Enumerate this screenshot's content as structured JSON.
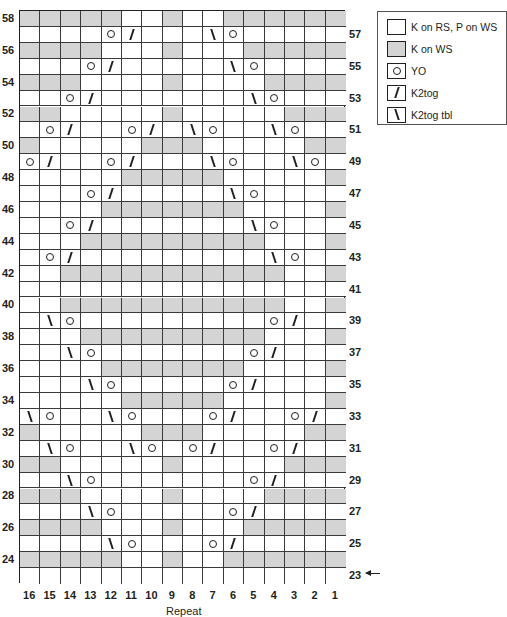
{
  "chart": {
    "columns": [
      "16",
      "15",
      "14",
      "13",
      "12",
      "11",
      "10",
      "9",
      "8",
      "7",
      "6",
      "5",
      "4",
      "3",
      "2",
      "1"
    ],
    "column_footer_label": "Repeat",
    "start_row_indicator": {
      "row": "23",
      "icon": "left-arrow-icon"
    },
    "rows": [
      {
        "num": "58",
        "side": "left",
        "cells": "ggggg..g..gggggg"
      },
      {
        "num": "57",
        "side": "right",
        "cells": "....o/...\\o....."
      },
      {
        "num": "56",
        "side": "left",
        "cells": "gggg...g...ggggg"
      },
      {
        "num": "55",
        "side": "right",
        "cells": "...o/.....\\o...."
      },
      {
        "num": "54",
        "side": "left",
        "cells": "ggg....g....gggg"
      },
      {
        "num": "53",
        "side": "right",
        "cells": "..o/.......\\o..."
      },
      {
        "num": "52",
        "side": "left",
        "cells": "gg.....g.....ggg"
      },
      {
        "num": "51",
        "side": "right",
        "cells": ".o/..o/.\\o..\\o.."
      },
      {
        "num": "50",
        "side": "left",
        "cells": "g.....ggg.....gg"
      },
      {
        "num": "49",
        "side": "right",
        "cells": "o/..o/...\\o..\\o."
      },
      {
        "num": "48",
        "side": "left",
        "cells": ".....ggggg.....g"
      },
      {
        "num": "47",
        "side": "right",
        "cells": "...o/.....\\o...."
      },
      {
        "num": "46",
        "side": "left",
        "cells": "....ggggggg....g"
      },
      {
        "num": "45",
        "side": "right",
        "cells": "..o/.......\\o..."
      },
      {
        "num": "44",
        "side": "left",
        "cells": "...ggggggggg...g"
      },
      {
        "num": "43",
        "side": "right",
        "cells": ".o/.........\\o.."
      },
      {
        "num": "42",
        "side": "left",
        "cells": "..ggggggggggg..g"
      },
      {
        "num": "41",
        "side": "right",
        "cells": "................"
      },
      {
        "num": "40",
        "side": "left",
        "cells": "..ggggggggggg..g"
      },
      {
        "num": "39",
        "side": "right",
        "cells": ".\\o.........o/.."
      },
      {
        "num": "38",
        "side": "left",
        "cells": "...ggggggggg...g"
      },
      {
        "num": "37",
        "side": "right",
        "cells": "..\\o.......o/..."
      },
      {
        "num": "36",
        "side": "left",
        "cells": "....ggggggg....g"
      },
      {
        "num": "35",
        "side": "right",
        "cells": "...\\o.....o/...."
      },
      {
        "num": "34",
        "side": "left",
        "cells": ".....ggggg.....g"
      },
      {
        "num": "33",
        "side": "right",
        "cells": "\\o..\\o...o/..o/."
      },
      {
        "num": "32",
        "side": "left",
        "cells": "g.....ggg.....gg"
      },
      {
        "num": "31",
        "side": "right",
        "cells": ".\\o..\\o.o/..o/.."
      },
      {
        "num": "30",
        "side": "left",
        "cells": "gg.....g.....ggg"
      },
      {
        "num": "29",
        "side": "right",
        "cells": "..\\o.......o/..."
      },
      {
        "num": "28",
        "side": "left",
        "cells": "ggg....g....gggg"
      },
      {
        "num": "27",
        "side": "right",
        "cells": "...\\o.....o/...."
      },
      {
        "num": "26",
        "side": "left",
        "cells": "gggg...g...ggggg"
      },
      {
        "num": "25",
        "side": "right",
        "cells": "....\\o...o/....."
      },
      {
        "num": "24",
        "side": "left",
        "cells": "ggggg..g..gggggg"
      },
      {
        "num": "23",
        "side": "right",
        "cells": "................"
      }
    ],
    "colors": {
      "shaded": "#d4d4d4",
      "plain": "#ffffff",
      "line": "#231f20"
    }
  },
  "legend": {
    "items": [
      {
        "symbol": "blank",
        "label": "K on RS, P on WS"
      },
      {
        "symbol": "shaded",
        "label": "K on WS"
      },
      {
        "symbol": "yo",
        "label": "YO"
      },
      {
        "symbol": "k2tog",
        "label": "K2tog"
      },
      {
        "symbol": "k2tog-tbl",
        "label": "K2tog tbl"
      }
    ]
  }
}
